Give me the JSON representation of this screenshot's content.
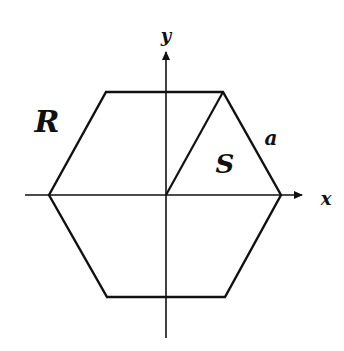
{
  "figure": {
    "type": "geometry-diagram",
    "colors": {
      "stroke": "#111111",
      "background": "#ffffff"
    },
    "axes": {
      "x_label": "x",
      "y_label": "y"
    },
    "labels": {
      "region": "R",
      "sub_region": "S",
      "side": "a"
    },
    "geometry": {
      "origin": [
        166,
        195
      ],
      "hexagon_vertices": [
        [
          49,
          195
        ],
        [
          106,
          92
        ],
        [
          223,
          92
        ],
        [
          281,
          195
        ],
        [
          225,
          297
        ],
        [
          107,
          297
        ]
      ],
      "diagonal": [
        [
          166,
          195
        ],
        [
          223,
          92
        ]
      ]
    }
  }
}
